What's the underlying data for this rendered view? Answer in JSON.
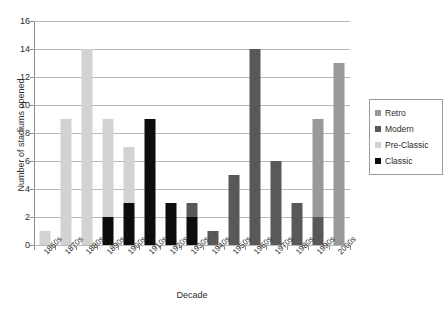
{
  "chart_data": {
    "type": "bar",
    "title": "",
    "subtitle": "",
    "xlabel": "Decade",
    "ylabel": "Number of stadiums opened",
    "stacked": true,
    "grid": true,
    "legend_position": "right",
    "ylim": [
      0,
      16
    ],
    "ytick_step": 2,
    "yticks": [
      "0",
      "2",
      "4",
      "6",
      "8",
      "10",
      "12",
      "14",
      "16"
    ],
    "categories": [
      "1860s",
      "1870s",
      "1880s",
      "1890s",
      "1900s",
      "1910s",
      "1920s",
      "1930s",
      "1940s",
      "1950s",
      "1960s",
      "1970s",
      "1980s",
      "1990s",
      "2000s"
    ],
    "series": [
      {
        "name": "Retro",
        "color": "#999999",
        "values": [
          0,
          0,
          0,
          0,
          0,
          0,
          0,
          0,
          0,
          0,
          0,
          0,
          0,
          7,
          13
        ]
      },
      {
        "name": "Modern",
        "color": "#595959",
        "values": [
          0,
          0,
          0,
          0,
          0,
          0,
          0,
          1,
          1,
          5,
          14,
          6,
          3,
          2,
          0
        ]
      },
      {
        "name": "Pre-Classic",
        "color": "#d2d2d2",
        "values": [
          1,
          9,
          14,
          7,
          4,
          0,
          0,
          0,
          0,
          0,
          0,
          0,
          0,
          0,
          0
        ]
      },
      {
        "name": "Classic",
        "color": "#0d0d0d",
        "values": [
          0,
          0,
          0,
          2,
          3,
          9,
          3,
          2,
          0,
          0,
          0,
          0,
          0,
          0,
          0
        ]
      }
    ],
    "totals": [
      1,
      9,
      14,
      9,
      7,
      9,
      3,
      3,
      1,
      5,
      14,
      6,
      3,
      9,
      13
    ],
    "stack_order_bottom_to_top": [
      "Classic",
      "Modern",
      "Retro",
      "Pre-Classic"
    ]
  },
  "legend": {
    "entries": [
      {
        "label": "Retro",
        "color": "#999999"
      },
      {
        "label": "Modern",
        "color": "#595959"
      },
      {
        "label": "Pre-Classic",
        "color": "#d2d2d2"
      },
      {
        "label": "Classic",
        "color": "#0d0d0d"
      }
    ]
  },
  "colors": {
    "axis": "#8c8c8c",
    "grid": "#b8b8b8",
    "text": "#2b2b2b",
    "background": "#ffffff"
  }
}
